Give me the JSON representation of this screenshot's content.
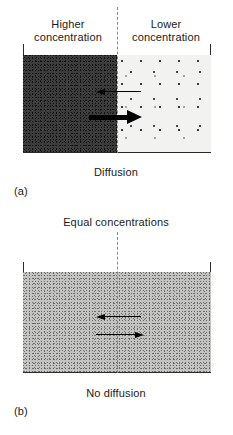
{
  "figure": {
    "panel_a": {
      "tag": "(a)",
      "caption": "Diffusion",
      "left_label": "Higher\nconcentration",
      "right_label": "Lower\nconcentration",
      "left_region": {
        "name": "high-concentration-region",
        "fill_color": "#3c3c3c"
      },
      "right_region": {
        "name": "low-concentration-region",
        "fill_color": "#f2f2f0"
      },
      "divider": {
        "style": "dashed",
        "color": "#8a8a8a"
      },
      "arrows": [
        {
          "name": "net-flux-leftward-thin",
          "direction": "left",
          "weight": "thin"
        },
        {
          "name": "net-flux-rightward-thick",
          "direction": "right",
          "weight": "thick"
        }
      ]
    },
    "panel_b": {
      "tag": "(b)",
      "caption": "No diffusion",
      "top_label": "Equal concentrations",
      "region": {
        "name": "equal-concentration-region",
        "fill_color": "#c3c3c1"
      },
      "divider": {
        "style": "dashed",
        "color": "#8a8a8a"
      },
      "arrows": [
        {
          "name": "flux-leftward-thin",
          "direction": "left",
          "weight": "thin"
        },
        {
          "name": "flux-rightward-thin",
          "direction": "right",
          "weight": "thin"
        }
      ]
    },
    "container_outline_color": "#2b2b2b"
  }
}
